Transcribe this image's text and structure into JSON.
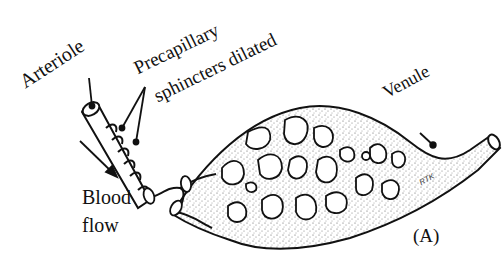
{
  "diagram": {
    "panel_label": "(A)",
    "labels": {
      "arteriole": "Arteriole",
      "precapillary_line1": "Precapillary",
      "precapillary_line2": "sphincters dilated",
      "venule": "Venule",
      "blood": "Blood",
      "flow": "flow",
      "signature": "RTK"
    },
    "colors": {
      "ink": "#111111",
      "background": "#ffffff",
      "stipple": "#555555"
    }
  }
}
